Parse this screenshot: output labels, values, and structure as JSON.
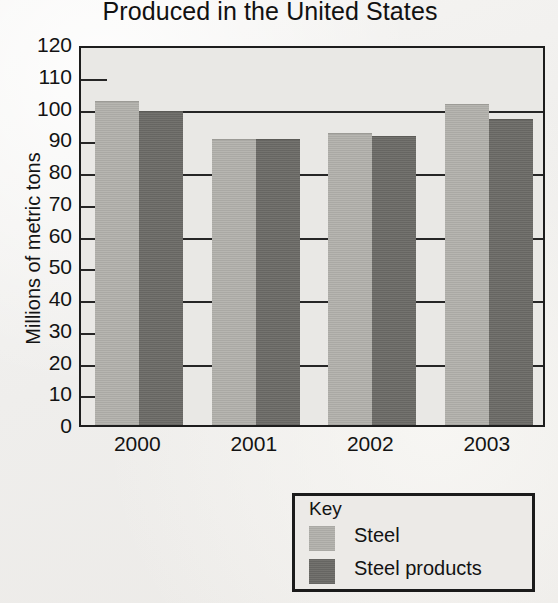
{
  "chart_data": {
    "type": "bar",
    "title": "Produced in the United States",
    "xlabel": "",
    "ylabel": "Millions of metric tons",
    "categories": [
      "2000",
      "2001",
      "2002",
      "2003"
    ],
    "series": [
      {
        "name": "Steel",
        "color": "#b3b2ad",
        "values": [
          102,
          90,
          92,
          101
        ]
      },
      {
        "name": "Steel products",
        "color": "#6e6d69",
        "values": [
          99,
          90,
          91,
          96.5
        ]
      }
    ],
    "ylim": [
      0,
      120
    ],
    "ytick_step": 10,
    "yticks": [
      "120",
      "110",
      "100",
      "90",
      "80",
      "70",
      "60",
      "50",
      "40",
      "30",
      "20",
      "10",
      "0"
    ],
    "grid": true,
    "legend_position": "below-right",
    "legend_title": "Key"
  }
}
